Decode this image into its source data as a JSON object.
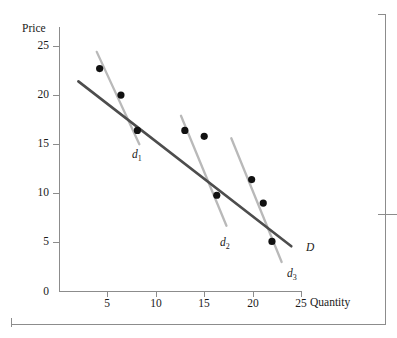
{
  "figure": {
    "name": "demand-curve-scatter-figure"
  },
  "chart_data": {
    "type": "scatter",
    "title": "",
    "subtitle": "",
    "xlabel": "Quantity",
    "ylabel": "Price",
    "xlim": [
      0,
      25.5
    ],
    "ylim": [
      0,
      26
    ],
    "grid": false,
    "legend": "none",
    "xticks": [
      "0",
      "5",
      "10",
      "15",
      "20",
      "25"
    ],
    "xtick_values": [
      0,
      5,
      10,
      15,
      20,
      25
    ],
    "yticks": [
      "0",
      "5",
      "10",
      "15",
      "20",
      "25"
    ],
    "ytick_values": [
      0,
      5,
      10,
      15,
      20,
      25
    ],
    "points": [
      {
        "x": 4.2,
        "y": 22.7
      },
      {
        "x": 6.4,
        "y": 20.0
      },
      {
        "x": 8.1,
        "y": 16.4
      },
      {
        "x": 13.0,
        "y": 16.4
      },
      {
        "x": 15.0,
        "y": 15.8
      },
      {
        "x": 16.3,
        "y": 9.8
      },
      {
        "x": 19.9,
        "y": 11.4
      },
      {
        "x": 21.1,
        "y": 9.0
      },
      {
        "x": 22.0,
        "y": 5.1
      }
    ],
    "series": [
      {
        "name": "D",
        "label": "D",
        "kind": "line",
        "color": "#4d4d4d",
        "x": [
          2.0,
          24.0
        ],
        "y": [
          21.4,
          4.6
        ],
        "label_position": {
          "x": 306,
          "y": 241
        }
      },
      {
        "name": "d1",
        "label": "d",
        "sub": "1",
        "kind": "segment",
        "color": "#b9b9b9",
        "x": [
          3.9,
          8.3
        ],
        "y": [
          24.4,
          15.0
        ],
        "label_position": {
          "x": 132,
          "y": 148
        }
      },
      {
        "name": "d2",
        "label": "d",
        "sub": "2",
        "kind": "segment",
        "color": "#b9b9b9",
        "x": [
          12.6,
          17.3
        ],
        "y": [
          17.9,
          6.7
        ],
        "label_position": {
          "x": 220,
          "y": 236
        }
      },
      {
        "name": "d3",
        "label": "d",
        "sub": "3",
        "kind": "segment",
        "color": "#b9b9b9",
        "x": [
          17.8,
          23.0
        ],
        "y": [
          15.6,
          3.0
        ],
        "label_position": {
          "x": 287,
          "y": 267
        }
      }
    ]
  }
}
